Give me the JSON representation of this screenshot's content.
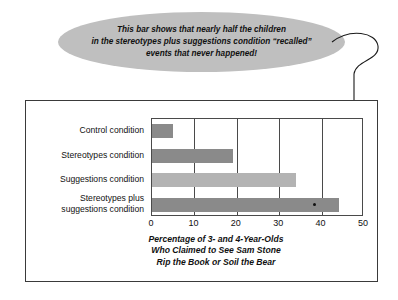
{
  "callout": {
    "lines": [
      "This bar shows that nearly half the children",
      "in the stereotypes plus suggestions condition “recalled”",
      "events that never happened!"
    ],
    "fill_color": "#bfbfbf",
    "pointer": "curved-leader-line"
  },
  "chart_data": {
    "type": "bar",
    "orientation": "horizontal",
    "title": "",
    "categories": [
      "Control condition",
      "Stereotypes condition",
      "Suggestions condition",
      "Stereotypes plus suggestions condition"
    ],
    "category_lines": [
      [
        "Control condition"
      ],
      [
        "Stereotypes condition"
      ],
      [
        "Suggestions condition"
      ],
      [
        "Stereotypes plus",
        "suggestions condition"
      ]
    ],
    "values": [
      5,
      19,
      34,
      44
    ],
    "bar_colors": [
      "#8a8a8a",
      "#8a8a8a",
      "#b3b3b3",
      "#8a8a8a"
    ],
    "xlabel": "Percentage of 3- and 4-Year-Olds Who Claimed to See Sam Stone Rip the Book or Soil the Bear",
    "xlabel_lines": [
      "Percentage of 3- and 4-Year-Olds",
      "Who Claimed to See Sam Stone",
      "Rip the Book or Soil the Bear"
    ],
    "ylabel": "",
    "xlim": [
      0,
      50
    ],
    "xticks": [
      0,
      10,
      20,
      30,
      40,
      50
    ],
    "xtick_labels": [
      "0",
      "10",
      "20",
      "30",
      "40",
      "50"
    ],
    "grid": true,
    "legend": false
  }
}
